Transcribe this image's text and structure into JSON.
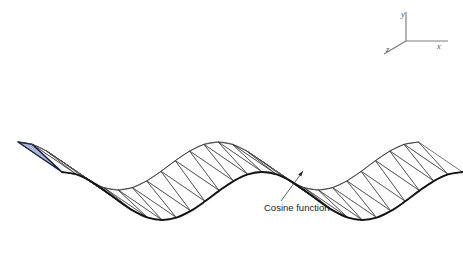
{
  "figure": {
    "background_color": "#ffffff",
    "width": 463,
    "height": 272
  },
  "annotation": {
    "label": "Cosine function",
    "label_x": 264,
    "label_y": 211,
    "leader_from_x": 281,
    "leader_from_y": 201,
    "leader_to_x": 303,
    "leader_to_y": 171
  },
  "axes": {
    "origin_x": 406,
    "origin_y": 41,
    "x_axis": {
      "label": "x",
      "end_x": 448,
      "end_y": 41,
      "label_x": 437,
      "label_y": 49
    },
    "y_axis": {
      "label": "y",
      "end_x": 406,
      "end_y": 12,
      "label_x": 401,
      "label_y": 17
    },
    "z_axis": {
      "label": "z",
      "end_x": 384,
      "end_y": 54,
      "label_x": 386,
      "label_y": 52
    },
    "color": "#7c7c86"
  },
  "highlight": {
    "name": "highlighted-triangle",
    "fill_color": "#a9b8dc",
    "stroke_color": "#1b2340"
  },
  "style": {
    "mesh_stroke": "#3a3a3a",
    "mesh_fill": "#ffffff",
    "curve_stroke": "#141414"
  },
  "chart_data": {
    "type": "line",
    "title": "Cosine function",
    "subtitle": "Triangulated surface strip of a cosine function in 3D oblique projection",
    "xlabel": "x",
    "ylabel": "y",
    "zlabel": "z",
    "grid": false,
    "legend": "none",
    "annotations": [
      "Cosine function"
    ],
    "function": "y = cos(x)",
    "amplitude": 1.0,
    "periods": 2.0,
    "xlim": [
      0,
      12.566
    ],
    "ylim": [
      -1,
      1
    ],
    "n_samples": 29,
    "x": [
      0,
      0.449,
      0.898,
      1.346,
      1.795,
      2.244,
      2.693,
      3.142,
      3.59,
      4.039,
      4.488,
      4.937,
      5.386,
      5.834,
      6.283,
      6.732,
      7.181,
      7.63,
      8.078,
      8.527,
      8.976,
      9.425,
      9.874,
      10.322,
      10.771,
      11.22,
      11.669,
      12.118,
      12.566
    ],
    "y": [
      1.0,
      0.901,
      0.623,
      0.223,
      -0.223,
      -0.623,
      -0.901,
      -1.0,
      -0.901,
      -0.623,
      -0.223,
      0.223,
      0.623,
      0.901,
      1.0,
      0.901,
      0.623,
      0.223,
      -0.223,
      -0.623,
      -0.901,
      -1.0,
      -0.901,
      -0.623,
      -0.223,
      0.223,
      0.623,
      0.901,
      1.0
    ],
    "series": [
      {
        "name": "Cosine function (front edge, z = 0)",
        "values": [
          1.0,
          0.901,
          0.623,
          0.223,
          -0.223,
          -0.623,
          -0.901,
          -1.0,
          -0.901,
          -0.623,
          -0.223,
          0.223,
          0.623,
          0.901,
          1.0,
          0.901,
          0.623,
          0.223,
          -0.223,
          -0.623,
          -0.901,
          -1.0,
          -0.901,
          -0.623,
          -0.223,
          0.223,
          0.623,
          0.901,
          1.0
        ]
      },
      {
        "name": "Ridge (back edge, z = 1)",
        "values": [
          1.0,
          0.901,
          0.623,
          0.223,
          -0.223,
          -0.623,
          -0.901,
          -1.0,
          -0.901,
          -0.623,
          -0.223,
          0.223,
          0.623,
          0.901,
          1.0,
          0.901,
          0.623,
          0.223,
          -0.223,
          -0.623,
          -0.901,
          -1.0,
          -0.901,
          -0.623,
          -0.223,
          0.223,
          0.623,
          0.901,
          1.0
        ]
      }
    ],
    "projection": {
      "type": "oblique",
      "x_step_px": 14.3,
      "y_scale_px": 24.0,
      "z_dx_px": -44.0,
      "z_dy_px": -30.0,
      "origin_px": [
        62,
        196
      ]
    }
  }
}
